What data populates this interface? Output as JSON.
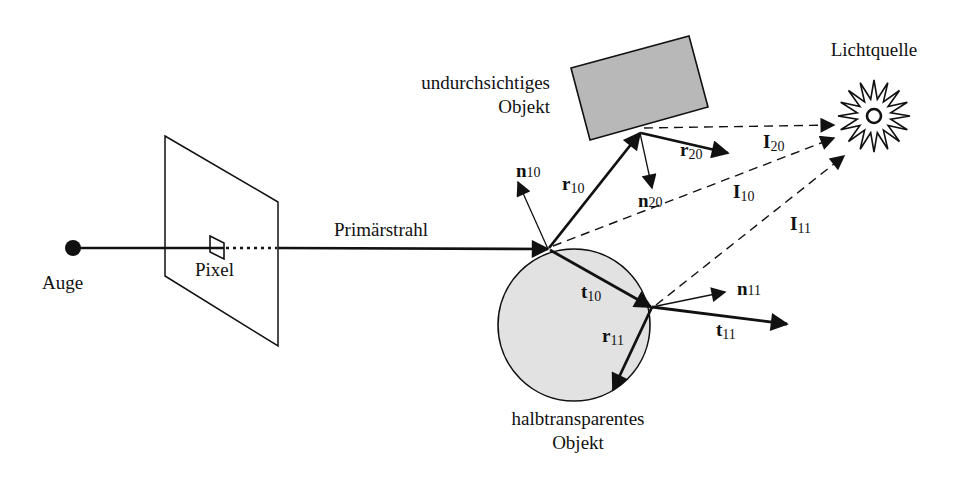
{
  "diagram": {
    "type": "ray-tracing-illustration",
    "colors": {
      "line": "#111111",
      "object_fill": "#b8b8b8",
      "sphere_fill": "#e2e2e2",
      "background": "#ffffff"
    },
    "labels": {
      "eye": "Auge",
      "pixel": "Pixel",
      "primary_ray": "Primärstrahl",
      "opaque_object_line1": "undurchsichtiges",
      "opaque_object_line2": "Objekt",
      "light_source": "Lichtquelle",
      "translucent_object_line1": "halbtransparentes",
      "translucent_object_line2": "Objekt"
    },
    "vectors": {
      "n10": {
        "base": "n",
        "sub": "10"
      },
      "r10": {
        "base": "r",
        "sub": "10"
      },
      "n20": {
        "base": "n",
        "sub": "20"
      },
      "r20": {
        "base": "r",
        "sub": "20"
      },
      "I20": {
        "base": "I",
        "sub": "20"
      },
      "I10": {
        "base": "I",
        "sub": "10"
      },
      "I11": {
        "base": "I",
        "sub": "11"
      },
      "t10": {
        "base": "t",
        "sub": "10"
      },
      "n11": {
        "base": "n",
        "sub": "11"
      },
      "t11": {
        "base": "t",
        "sub": "11"
      },
      "r11": {
        "base": "r",
        "sub": "11"
      }
    }
  }
}
